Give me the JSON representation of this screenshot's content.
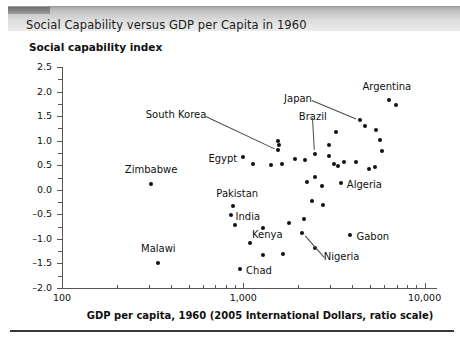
{
  "title": "Social Capability versus GDP per Capita in 1960",
  "chart_data": {
    "type": "scatter",
    "title": "Social Capability versus GDP per Capita in 1960",
    "xlabel": "GDP per capita, 1960 (2005 International Dollars, ratio scale)",
    "ylabel": "Social capability index",
    "xscale": "log",
    "xlim": [
      100,
      12500
    ],
    "ylim": [
      -2.0,
      2.5
    ],
    "grid": false,
    "legend": null,
    "x_major_ticks": [
      100,
      1000,
      10000
    ],
    "x_major_tick_labels": [
      "100",
      "1,000",
      "10,000"
    ],
    "y_major_ticks": [
      -2.0,
      -1.5,
      -1.0,
      -0.5,
      0.0,
      0.5,
      1.0,
      1.5,
      2.0,
      2.5
    ],
    "y_major_tick_labels": [
      "-2.0",
      "-1.5",
      "-1.0",
      "-0.5",
      "0.0",
      "0.5",
      "1.0",
      "1.5",
      "2.0",
      "2.5"
    ],
    "y_minor_step": 0.25,
    "points": [
      {
        "name": "Zimbabwe",
        "x": 310,
        "y": 0.12,
        "label": "Zimbabwe",
        "label_pos": "above",
        "dx": 0,
        "dy": -13,
        "anchor": "middle",
        "leader": false
      },
      {
        "name": "Malawi",
        "x": 340,
        "y": -1.5,
        "label": "Malawi",
        "label_pos": "above",
        "dx": 0,
        "dy": -13,
        "anchor": "middle",
        "leader": false
      },
      {
        "name": "Pakistan",
        "x": 880,
        "y": -0.33,
        "label": "Pakistan",
        "label_pos": "above",
        "dx": 4,
        "dy": -11,
        "anchor": "middle",
        "leader": false
      },
      {
        "name": "India",
        "x": 850,
        "y": -0.52,
        "label": "India",
        "label_pos": "right",
        "dx": 5,
        "dy": 3,
        "anchor": "start",
        "leader": false
      },
      {
        "name": "Kenya",
        "x": 900,
        "y": -0.72,
        "label": "Kenya",
        "label_pos": "right",
        "dx": 17,
        "dy": 11,
        "anchor": "start",
        "leader": false
      },
      {
        "name": "Chad",
        "x": 960,
        "y": -1.62,
        "label": "Chad",
        "label_pos": "right",
        "dx": 6,
        "dy": 3,
        "anchor": "start",
        "leader": false
      },
      {
        "name": "Egypt",
        "x": 1000,
        "y": 0.66,
        "label": "Egypt",
        "label_pos": "left",
        "dx": -6,
        "dy": 3,
        "anchor": "end",
        "leader": false
      },
      {
        "name": "South Korea",
        "x": 1560,
        "y": 0.82,
        "label": "South Korea",
        "label_pos": "leader",
        "dx": -72,
        "dy": -34,
        "anchor": "end",
        "leader": true
      },
      {
        "name": "Nigeria",
        "x": 2100,
        "y": -0.88,
        "label": "Nigeria",
        "label_pos": "leader",
        "dx": 22,
        "dy": 25,
        "anchor": "start",
        "leader": true
      },
      {
        "name": "Brazil",
        "x": 2480,
        "y": 0.72,
        "label": "Brazil",
        "label_pos": "leader",
        "dx": -2,
        "dy": -36,
        "anchor": "middle",
        "leader": true
      },
      {
        "name": "Japan",
        "x": 4400,
        "y": 1.42,
        "label": "Japan",
        "label_pos": "leader",
        "dx": -48,
        "dy": -20,
        "anchor": "end",
        "leader": true
      },
      {
        "name": "Argentina",
        "x": 6350,
        "y": 1.82,
        "label": "Argentina",
        "label_pos": "above",
        "dx": -2,
        "dy": -12,
        "anchor": "middle",
        "leader": false
      },
      {
        "name": "Algeria",
        "x": 3450,
        "y": 0.14,
        "label": "Algeria",
        "label_pos": "right",
        "dx": 6,
        "dy": 3,
        "anchor": "start",
        "leader": false
      },
      {
        "name": "Gabon",
        "x": 3900,
        "y": -0.92,
        "label": "Gabon",
        "label_pos": "right",
        "dx": 6,
        "dy": 3,
        "anchor": "start",
        "leader": false
      },
      {
        "name": "unlabeled-1",
        "x": 1130,
        "y": 0.52,
        "label": null
      },
      {
        "name": "unlabeled-2",
        "x": 1420,
        "y": 0.5,
        "label": null
      },
      {
        "name": "unlabeled-3",
        "x": 1640,
        "y": 0.52,
        "label": null
      },
      {
        "name": "unlabeled-4",
        "x": 1560,
        "y": 1.0,
        "label": null
      },
      {
        "name": "unlabeled-5",
        "x": 1580,
        "y": 0.92,
        "label": null
      },
      {
        "name": "unlabeled-6",
        "x": 1920,
        "y": 0.62,
        "label": null
      },
      {
        "name": "unlabeled-7",
        "x": 2200,
        "y": 0.6,
        "label": null
      },
      {
        "name": "unlabeled-8",
        "x": 2480,
        "y": 0.26,
        "label": null
      },
      {
        "name": "unlabeled-9",
        "x": 2700,
        "y": 0.08,
        "label": null
      },
      {
        "name": "unlabeled-10",
        "x": 2260,
        "y": 0.16,
        "label": null
      },
      {
        "name": "unlabeled-11",
        "x": 2400,
        "y": -0.22,
        "label": null
      },
      {
        "name": "unlabeled-12",
        "x": 2740,
        "y": -0.3,
        "label": null
      },
      {
        "name": "unlabeled-13",
        "x": 2980,
        "y": 0.92,
        "label": null
      },
      {
        "name": "unlabeled-14",
        "x": 2980,
        "y": 0.68,
        "label": null
      },
      {
        "name": "unlabeled-15",
        "x": 3180,
        "y": 0.52,
        "label": null
      },
      {
        "name": "unlabeled-16",
        "x": 3330,
        "y": 0.48,
        "label": null
      },
      {
        "name": "unlabeled-17",
        "x": 3600,
        "y": 0.56,
        "label": null
      },
      {
        "name": "unlabeled-18",
        "x": 2150,
        "y": -0.6,
        "label": null
      },
      {
        "name": "unlabeled-19",
        "x": 1280,
        "y": -0.78,
        "label": null
      },
      {
        "name": "unlabeled-20",
        "x": 1090,
        "y": -1.08,
        "label": null
      },
      {
        "name": "unlabeled-21",
        "x": 1280,
        "y": -1.32,
        "label": null
      },
      {
        "name": "unlabeled-22",
        "x": 1660,
        "y": -1.3,
        "label": null
      },
      {
        "name": "unlabeled-23",
        "x": 1780,
        "y": -0.68,
        "label": null
      },
      {
        "name": "unlabeled-24",
        "x": 2480,
        "y": -1.18,
        "label": null
      },
      {
        "name": "unlabeled-25",
        "x": 4720,
        "y": 1.3,
        "label": null
      },
      {
        "name": "unlabeled-26",
        "x": 5400,
        "y": 1.22,
        "label": null
      },
      {
        "name": "unlabeled-27",
        "x": 5700,
        "y": 1.02,
        "label": null
      },
      {
        "name": "unlabeled-28",
        "x": 5850,
        "y": 0.8,
        "label": null
      },
      {
        "name": "unlabeled-29",
        "x": 6950,
        "y": 1.72,
        "label": null
      },
      {
        "name": "unlabeled-30",
        "x": 4950,
        "y": 0.42,
        "label": null
      },
      {
        "name": "unlabeled-31",
        "x": 5350,
        "y": 0.46,
        "label": null
      },
      {
        "name": "unlabeled-32",
        "x": 4200,
        "y": 0.56,
        "label": null
      },
      {
        "name": "unlabeled-33",
        "x": 3250,
        "y": 1.18,
        "label": null
      }
    ]
  }
}
